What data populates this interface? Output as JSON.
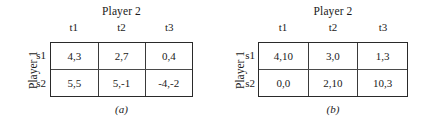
{
  "figure": {
    "panels": [
      {
        "caption": "(a)",
        "column_player_label": "Player 2",
        "row_player_label": "Player 1",
        "column_headers": [
          "t1",
          "t2",
          "t3"
        ],
        "row_headers": [
          "s1",
          "s2"
        ],
        "cells": [
          [
            "4,3",
            "2,7",
            "0,4"
          ],
          [
            "5,5",
            "5,-1",
            "-4,-2"
          ]
        ]
      },
      {
        "caption": "(b)",
        "column_player_label": "Player 2",
        "row_player_label": "Player 1",
        "column_headers": [
          "t1",
          "t2",
          "t3"
        ],
        "row_headers": [
          "s1",
          "s2"
        ],
        "cells": [
          [
            "4,10",
            "3,0",
            "1,3"
          ],
          [
            "0,0",
            "2,10",
            "10,3"
          ]
        ]
      }
    ],
    "colors": {
      "background": "#ffffff",
      "text": "#1a1a1a",
      "outer_border": "#2a2a2a",
      "inner_border": "#3a3a3a"
    }
  }
}
